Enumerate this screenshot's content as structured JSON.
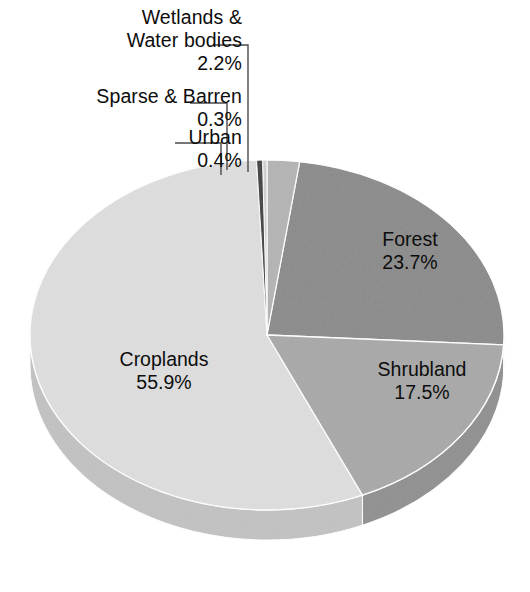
{
  "figure": {
    "background": "#ffffff",
    "text_color": "#0d0d0d"
  },
  "chart_data": {
    "type": "pie",
    "title": "",
    "subtitle": "",
    "xlabel": "",
    "ylabel": "",
    "units": "percent",
    "legend_position": "none",
    "grid": false,
    "style": "3d-pie-grayscale",
    "start_angle_deg": 0,
    "direction": "clockwise",
    "categories": [
      "Wetlands & Water bodies",
      "Forest",
      "Shrubland",
      "Croplands",
      "Urban",
      "Sparse & Barren"
    ],
    "values": [
      2.2,
      23.7,
      17.5,
      55.9,
      0.4,
      0.3
    ],
    "labels_formatted": [
      "2.2%",
      "23.7%",
      "17.5%",
      "55.9%",
      "0.4%",
      "0.3%"
    ],
    "colors": [
      "#b4b4b4",
      "#8a8a8a",
      "#a8a8a8",
      "#dedede",
      "#3a3a3a",
      "#d0d0d0"
    ],
    "side_colors": [
      "#9a9a9a",
      "#757575",
      "#8f8f8f",
      "#c2c2c2",
      "#2e2e2e",
      "#b4b4b4"
    ],
    "slices": [
      {
        "name": "Wetlands & Water bodies",
        "value": 2.2,
        "label": "2.2%",
        "color": "#b4b4b4",
        "callout": true
      },
      {
        "name": "Forest",
        "value": 23.7,
        "label": "23.7%",
        "color": "#8a8a8a",
        "callout": false
      },
      {
        "name": "Shrubland",
        "value": 17.5,
        "label": "17.5%",
        "color": "#a8a8a8",
        "callout": false
      },
      {
        "name": "Croplands",
        "value": 55.9,
        "label": "55.9%",
        "color": "#dedede",
        "callout": false
      },
      {
        "name": "Urban",
        "value": 0.4,
        "label": "0.4%",
        "color": "#3a3a3a",
        "callout": true
      },
      {
        "name": "Sparse & Barren",
        "value": 0.3,
        "label": "0.3%",
        "color": "#d0d0d0",
        "callout": true
      }
    ]
  },
  "callouts": {
    "wetlands": {
      "line1": "Wetlands &",
      "line2": "Water bodies",
      "percent": "2.2%"
    },
    "sparse": {
      "line1": "Sparse & Barren",
      "percent": "0.3%"
    },
    "urban": {
      "line1": "Urban",
      "percent": "0.4%"
    }
  },
  "inner_labels": {
    "forest": {
      "name": "Forest",
      "percent": "23.7%"
    },
    "shrubland": {
      "name": "Shrubland",
      "percent": "17.5%"
    },
    "croplands": {
      "name": "Croplands",
      "percent": "55.9%"
    }
  }
}
